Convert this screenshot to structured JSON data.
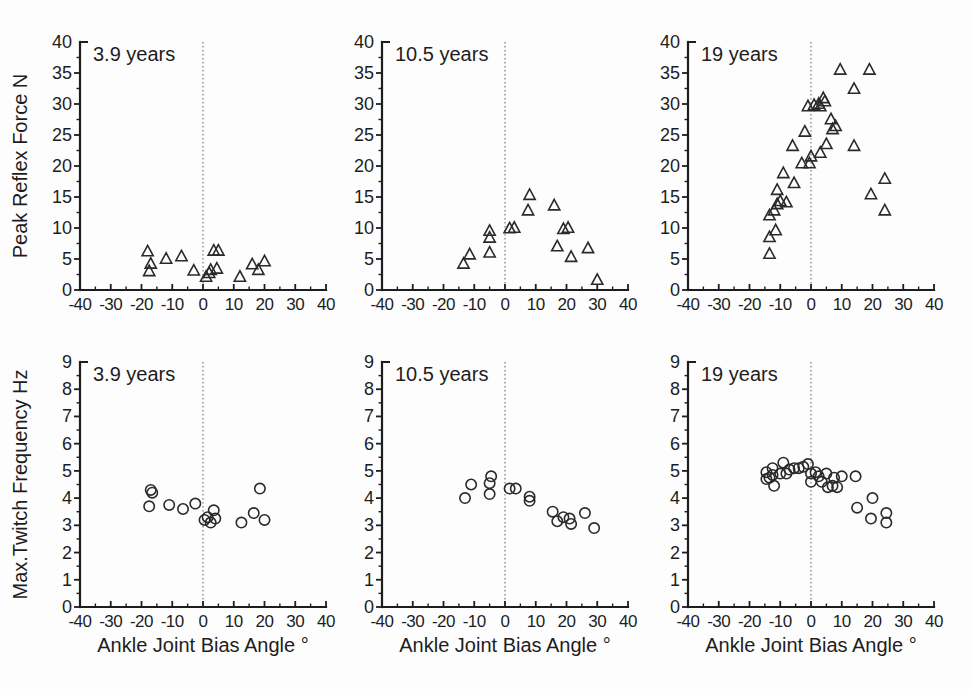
{
  "figure": {
    "background": "#fdfdfd",
    "ink_color": "#1d1d1d",
    "zero_line_color": "#6e6e6e",
    "x_axis_label": "Ankle Joint Bias Angle °",
    "top_row_ylabel": "Peak Reflex Force N",
    "bottom_row_ylabel": "Max.Twitch Frequency Hz",
    "age_labels": [
      "3.9 years",
      "10.5 years",
      "19 years"
    ]
  },
  "chart_data": [
    {
      "id": "peak-reflex-3-9-years",
      "type": "scatter",
      "marker": "triangle-open",
      "title": "3.9 years",
      "xlabel": "",
      "ylabel": "Peak Reflex Force N",
      "xlim": [
        -40,
        40
      ],
      "ylim": [
        0,
        40
      ],
      "xticks": [
        -40,
        -30,
        -20,
        -10,
        0,
        10,
        20,
        30,
        40
      ],
      "yticks": [
        0,
        5,
        10,
        15,
        20,
        25,
        30,
        35,
        40
      ],
      "zero_reference_line": true,
      "points": [
        [
          -18,
          6.2
        ],
        [
          -17,
          4.2
        ],
        [
          -17.5,
          3.0
        ],
        [
          -12,
          5.0
        ],
        [
          -7,
          5.4
        ],
        [
          -3,
          3.1
        ],
        [
          1,
          2.1
        ],
        [
          2,
          2.7
        ],
        [
          2.5,
          3.2
        ],
        [
          3.5,
          6.3
        ],
        [
          5,
          6.3
        ],
        [
          4.5,
          3.4
        ],
        [
          12,
          2.1
        ],
        [
          16,
          4.1
        ],
        [
          18,
          3.2
        ],
        [
          20,
          4.6
        ]
      ]
    },
    {
      "id": "peak-reflex-10-5-years",
      "type": "scatter",
      "marker": "triangle-open",
      "title": "10.5 years",
      "xlabel": "",
      "ylabel": "Peak Reflex Force N",
      "xlim": [
        -40,
        40
      ],
      "ylim": [
        0,
        40
      ],
      "xticks": [
        -40,
        -30,
        -20,
        -10,
        0,
        10,
        20,
        30,
        40
      ],
      "yticks": [
        0,
        5,
        10,
        15,
        20,
        25,
        30,
        35,
        40
      ],
      "zero_reference_line": true,
      "points": [
        [
          -13.5,
          4.2
        ],
        [
          -11.5,
          5.7
        ],
        [
          -5,
          6.0
        ],
        [
          -5,
          8.4
        ],
        [
          -5,
          9.5
        ],
        [
          1.5,
          9.9
        ],
        [
          3,
          10.0
        ],
        [
          7.5,
          12.8
        ],
        [
          8,
          15.3
        ],
        [
          16,
          13.6
        ],
        [
          17,
          7.0
        ],
        [
          19,
          9.8
        ],
        [
          20.5,
          10.0
        ],
        [
          21.5,
          5.3
        ],
        [
          27,
          6.7
        ],
        [
          30,
          1.6
        ]
      ]
    },
    {
      "id": "peak-reflex-19-years",
      "type": "scatter",
      "marker": "triangle-open",
      "title": "19 years",
      "xlabel": "",
      "ylabel": "Peak Reflex Force N",
      "xlim": [
        -40,
        40
      ],
      "ylim": [
        0,
        40
      ],
      "xticks": [
        -40,
        -30,
        -20,
        -10,
        0,
        10,
        20,
        30,
        40
      ],
      "yticks": [
        0,
        5,
        10,
        15,
        20,
        25,
        30,
        35,
        40
      ],
      "zero_reference_line": true,
      "points": [
        [
          -13.5,
          5.8
        ],
        [
          -13.5,
          8.5
        ],
        [
          -11.5,
          9.6
        ],
        [
          -13.5,
          12.0
        ],
        [
          -12,
          12.8
        ],
        [
          -11,
          13.8
        ],
        [
          -10,
          14.3
        ],
        [
          -8,
          14.1
        ],
        [
          -11,
          16.1
        ],
        [
          -9,
          18.8
        ],
        [
          -5.5,
          17.2
        ],
        [
          -6,
          23.2
        ],
        [
          -3,
          20.4
        ],
        [
          -2,
          25.5
        ],
        [
          -0.5,
          20.4
        ],
        [
          0,
          21.5
        ],
        [
          -1,
          29.6
        ],
        [
          1,
          29.8
        ],
        [
          2.5,
          30.0
        ],
        [
          3,
          29.6
        ],
        [
          4,
          30.9
        ],
        [
          4.5,
          30.4
        ],
        [
          3,
          22.1
        ],
        [
          5,
          23.5
        ],
        [
          6.5,
          27.5
        ],
        [
          7,
          25.9
        ],
        [
          8,
          26.4
        ],
        [
          9.5,
          35.5
        ],
        [
          14,
          32.4
        ],
        [
          14,
          23.2
        ],
        [
          19,
          35.5
        ],
        [
          19.5,
          15.4
        ],
        [
          24,
          17.9
        ],
        [
          24,
          12.8
        ]
      ]
    },
    {
      "id": "max-twitch-3-9-years",
      "type": "scatter",
      "marker": "circle-open",
      "title": "3.9 years",
      "xlabel": "Ankle Joint Bias Angle °",
      "ylabel": "Max.Twitch Frequency Hz",
      "xlim": [
        -40,
        40
      ],
      "ylim": [
        0,
        9
      ],
      "xticks": [
        -40,
        -30,
        -20,
        -10,
        0,
        10,
        20,
        30,
        40
      ],
      "yticks": [
        0,
        1,
        2,
        3,
        4,
        5,
        6,
        7,
        8,
        9
      ],
      "zero_reference_line": true,
      "points": [
        [
          -17.5,
          3.7
        ],
        [
          -17,
          4.3
        ],
        [
          -16.5,
          4.2
        ],
        [
          -11,
          3.75
        ],
        [
          -6.5,
          3.6
        ],
        [
          -2.5,
          3.8
        ],
        [
          0.5,
          3.2
        ],
        [
          1.5,
          3.3
        ],
        [
          2.5,
          3.1
        ],
        [
          3.5,
          3.55
        ],
        [
          4,
          3.25
        ],
        [
          12.5,
          3.1
        ],
        [
          16.5,
          3.45
        ],
        [
          18.5,
          4.35
        ],
        [
          20,
          3.2
        ]
      ]
    },
    {
      "id": "max-twitch-10-5-years",
      "type": "scatter",
      "marker": "circle-open",
      "title": "10.5 years",
      "xlabel": "Ankle Joint Bias Angle °",
      "ylabel": "Max.Twitch Frequency Hz",
      "xlim": [
        -40,
        40
      ],
      "ylim": [
        0,
        9
      ],
      "xticks": [
        -40,
        -30,
        -20,
        -10,
        0,
        10,
        20,
        30,
        40
      ],
      "yticks": [
        0,
        1,
        2,
        3,
        4,
        5,
        6,
        7,
        8,
        9
      ],
      "zero_reference_line": true,
      "points": [
        [
          -13,
          4.0
        ],
        [
          -11,
          4.5
        ],
        [
          -4.5,
          4.8
        ],
        [
          -5,
          4.55
        ],
        [
          -5,
          4.15
        ],
        [
          1.5,
          4.35
        ],
        [
          3.5,
          4.35
        ],
        [
          8,
          4.05
        ],
        [
          8,
          3.9
        ],
        [
          15.5,
          3.5
        ],
        [
          17,
          3.15
        ],
        [
          19,
          3.3
        ],
        [
          21,
          3.25
        ],
        [
          21.5,
          3.05
        ],
        [
          26,
          3.45
        ],
        [
          29,
          2.9
        ]
      ]
    },
    {
      "id": "max-twitch-19-years",
      "type": "scatter",
      "marker": "circle-open",
      "title": "19 years",
      "xlabel": "Ankle Joint Bias Angle °",
      "ylabel": "Max.Twitch Frequency Hz",
      "xlim": [
        -40,
        40
      ],
      "ylim": [
        0,
        9
      ],
      "xticks": [
        -40,
        -30,
        -20,
        -10,
        0,
        10,
        20,
        30,
        40
      ],
      "yticks": [
        0,
        1,
        2,
        3,
        4,
        5,
        6,
        7,
        8,
        9
      ],
      "zero_reference_line": true,
      "points": [
        [
          -14.5,
          4.95
        ],
        [
          -14.5,
          4.7
        ],
        [
          -13.5,
          4.75
        ],
        [
          -12.5,
          5.1
        ],
        [
          -12.5,
          4.85
        ],
        [
          -12,
          4.45
        ],
        [
          -10,
          4.9
        ],
        [
          -9,
          5.3
        ],
        [
          -8,
          4.9
        ],
        [
          -7,
          5.05
        ],
        [
          -5.5,
          5.1
        ],
        [
          -4,
          5.1
        ],
        [
          -2.5,
          5.15
        ],
        [
          -1,
          5.25
        ],
        [
          0,
          4.9
        ],
        [
          0,
          4.6
        ],
        [
          1.5,
          4.95
        ],
        [
          2.5,
          4.8
        ],
        [
          3.5,
          4.6
        ],
        [
          5,
          4.9
        ],
        [
          5.5,
          4.4
        ],
        [
          7,
          4.45
        ],
        [
          7.5,
          4.75
        ],
        [
          8.5,
          4.4
        ],
        [
          10,
          4.8
        ],
        [
          14.5,
          4.8
        ],
        [
          15,
          3.65
        ],
        [
          20,
          4.0
        ],
        [
          19.5,
          3.25
        ],
        [
          24.5,
          3.45
        ],
        [
          24.5,
          3.1
        ]
      ]
    }
  ]
}
